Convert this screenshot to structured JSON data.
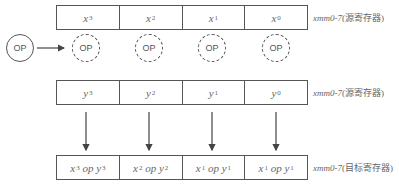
{
  "operator": {
    "label": "OP"
  },
  "source_register_1": {
    "cells": [
      {
        "base": "x",
        "sub": "3"
      },
      {
        "base": "x",
        "sub": "2"
      },
      {
        "base": "x",
        "sub": "1"
      },
      {
        "base": "x",
        "sub": "0"
      }
    ],
    "label_name": "xmm0-7",
    "label_desc": "(源寄存器)"
  },
  "lane_ops": [
    "OP",
    "OP",
    "OP",
    "OP"
  ],
  "source_register_2": {
    "cells": [
      {
        "base": "y",
        "sub": "3"
      },
      {
        "base": "y",
        "sub": "2"
      },
      {
        "base": "y",
        "sub": "1"
      },
      {
        "base": "y",
        "sub": "0"
      }
    ],
    "label_name": "xmm0-7",
    "label_desc": "(源寄存器)"
  },
  "dest_register": {
    "cells": [
      {
        "a": "x",
        "asub": "3",
        "op": "op",
        "b": "y",
        "bsub": "3"
      },
      {
        "a": "x",
        "asub": "2",
        "op": "op",
        "b": "y",
        "bsub": "2"
      },
      {
        "a": "x",
        "asub": "1",
        "op": "op",
        "b": "y",
        "bsub": "1"
      },
      {
        "a": "x",
        "asub": "1",
        "op": "op",
        "b": "y",
        "bsub": "1"
      }
    ],
    "label_name": "xmm0-7",
    "label_desc": "(目标寄存器)"
  }
}
